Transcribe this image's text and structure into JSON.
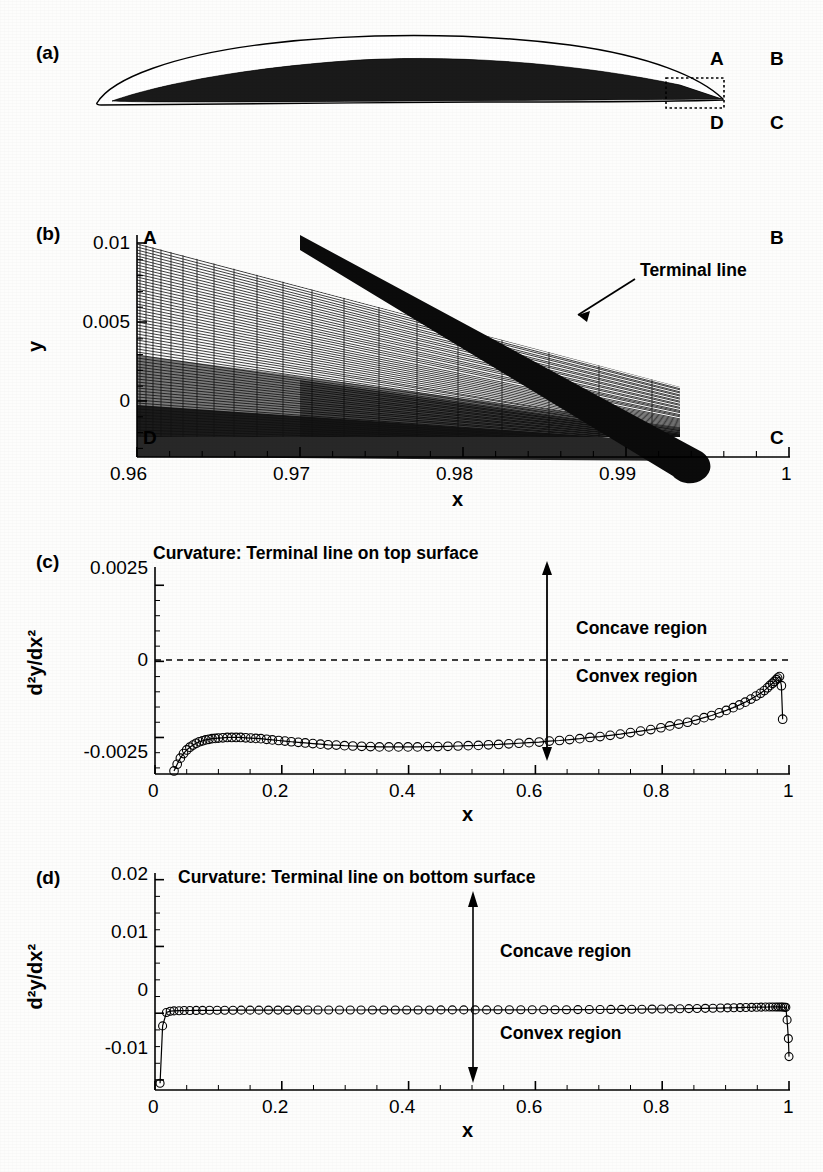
{
  "figure": {
    "panels": [
      "(a)",
      "(b)",
      "(c)",
      "(d)"
    ]
  },
  "panel_a": {
    "label": "(a)",
    "corner_labels": {
      "A": "A",
      "B": "B",
      "C": "C",
      "D": "D"
    },
    "description": "Airfoil with filled grid region and dotted zoom box at trailing edge"
  },
  "panel_b": {
    "label": "(b)",
    "corner_labels": {
      "A": "A",
      "B": "B",
      "C": "C",
      "D": "D"
    },
    "annotation": "Terminal line",
    "xlabel": "x",
    "ylabel": "y",
    "xticks": [
      "0.96",
      "0.97",
      "0.98",
      "0.99",
      "1"
    ],
    "yticks": [
      "0.01",
      "0.005",
      "0"
    ],
    "xlim": [
      0.96,
      1.0
    ],
    "ylim": [
      -0.0025,
      0.0115
    ]
  },
  "panel_c": {
    "label": "(c)",
    "title": "Curvature: Terminal line on top surface",
    "xlabel": "x",
    "ylabel": "d²y/dx²",
    "xticks": [
      "0",
      "0.2",
      "0.4",
      "0.6",
      "0.8",
      "1"
    ],
    "yticks": [
      "0.0025",
      "0",
      "-0.0025"
    ],
    "region_upper": "Concave region",
    "region_lower": "Convex region",
    "arrow_x": 0.63
  },
  "panel_d": {
    "label": "(d)",
    "title": "Curvature: Terminal line on bottom surface",
    "xlabel": "x",
    "ylabel": "d²y/dx²",
    "xticks": [
      "0",
      "0.2",
      "0.4",
      "0.6",
      "0.8",
      "1"
    ],
    "yticks": [
      "0.02",
      "0.01",
      "0",
      "-0.01"
    ],
    "region_upper": "Concave region",
    "region_lower": "Convex region",
    "arrow_x": 0.5
  },
  "chart_data": [
    {
      "id": "panel_c",
      "type": "line",
      "title": "Curvature: Terminal line on top surface",
      "xlabel": "x",
      "ylabel": "d2y/dx2",
      "xlim": [
        0,
        1
      ],
      "ylim": [
        -0.0037,
        0.0031
      ],
      "grid": false,
      "legend": null,
      "marker": "open-circle",
      "zero_line": true,
      "annotations": [
        "Concave region",
        "Convex region"
      ],
      "x": [
        0.03,
        0.035,
        0.04,
        0.045,
        0.05,
        0.055,
        0.06,
        0.065,
        0.07,
        0.075,
        0.08,
        0.085,
        0.09,
        0.095,
        0.1,
        0.107,
        0.114,
        0.121,
        0.128,
        0.135,
        0.143,
        0.151,
        0.159,
        0.167,
        0.176,
        0.185,
        0.195,
        0.205,
        0.215,
        0.226,
        0.237,
        0.249,
        0.261,
        0.273,
        0.286,
        0.299,
        0.312,
        0.326,
        0.34,
        0.354,
        0.369,
        0.384,
        0.399,
        0.414,
        0.43,
        0.446,
        0.462,
        0.478,
        0.494,
        0.51,
        0.526,
        0.542,
        0.558,
        0.574,
        0.59,
        0.606,
        0.622,
        0.638,
        0.654,
        0.67,
        0.686,
        0.702,
        0.718,
        0.734,
        0.75,
        0.766,
        0.782,
        0.798,
        0.812,
        0.826,
        0.84,
        0.853,
        0.866,
        0.878,
        0.89,
        0.901,
        0.912,
        0.922,
        0.931,
        0.94,
        0.948,
        0.955,
        0.961,
        0.966,
        0.97,
        0.974,
        0.977,
        0.98,
        0.982,
        0.985,
        0.988,
        0.99
      ],
      "y": [
        -0.0036,
        -0.00338,
        -0.00318,
        -0.00303,
        -0.00291,
        -0.00282,
        -0.00275,
        -0.00269,
        -0.00264,
        -0.00261,
        -0.00258,
        -0.00256,
        -0.00254,
        -0.00253,
        -0.00252,
        -0.00251,
        -0.0025,
        -0.0025,
        -0.0025,
        -0.0025,
        -0.00251,
        -0.00252,
        -0.00253,
        -0.00254,
        -0.00256,
        -0.00258,
        -0.0026,
        -0.00262,
        -0.00264,
        -0.00266,
        -0.00268,
        -0.0027,
        -0.00272,
        -0.00274,
        -0.00275,
        -0.00277,
        -0.00278,
        -0.00279,
        -0.0028,
        -0.00281,
        -0.00281,
        -0.00281,
        -0.00281,
        -0.00281,
        -0.0028,
        -0.0028,
        -0.00279,
        -0.00278,
        -0.00277,
        -0.00276,
        -0.00274,
        -0.00273,
        -0.00271,
        -0.00269,
        -0.00267,
        -0.00265,
        -0.00262,
        -0.0026,
        -0.00257,
        -0.00254,
        -0.0025,
        -0.00247,
        -0.00243,
        -0.00239,
        -0.00234,
        -0.00229,
        -0.00224,
        -0.00218,
        -0.00212,
        -0.00206,
        -0.002,
        -0.00193,
        -0.00185,
        -0.00178,
        -0.00169,
        -0.00161,
        -0.00152,
        -0.00143,
        -0.00134,
        -0.00124,
        -0.00114,
        -0.00105,
        -0.00096,
        -0.00087,
        -0.00079,
        -0.00072,
        -0.00066,
        -0.0006,
        -0.00055,
        -0.0005,
        -0.0008,
        -0.0019
      ]
    },
    {
      "id": "panel_d",
      "type": "line",
      "title": "Curvature: Terminal line on bottom surface",
      "xlabel": "x",
      "ylabel": "d2y/dx2",
      "xlim": [
        0,
        1
      ],
      "ylim": [
        -0.0115,
        0.021
      ],
      "grid": false,
      "legend": null,
      "marker": "open-circle",
      "zero_line": false,
      "annotations": [
        "Concave region",
        "Convex region"
      ],
      "x": [
        0.008,
        0.012,
        0.018,
        0.024,
        0.03,
        0.038,
        0.046,
        0.055,
        0.065,
        0.075,
        0.086,
        0.098,
        0.11,
        0.123,
        0.136,
        0.15,
        0.164,
        0.179,
        0.194,
        0.209,
        0.225,
        0.241,
        0.257,
        0.274,
        0.291,
        0.308,
        0.325,
        0.343,
        0.361,
        0.379,
        0.397,
        0.415,
        0.433,
        0.451,
        0.469,
        0.487,
        0.505,
        0.523,
        0.541,
        0.559,
        0.577,
        0.595,
        0.613,
        0.631,
        0.649,
        0.667,
        0.685,
        0.702,
        0.719,
        0.736,
        0.752,
        0.768,
        0.784,
        0.799,
        0.814,
        0.828,
        0.842,
        0.855,
        0.868,
        0.88,
        0.892,
        0.903,
        0.913,
        0.923,
        0.932,
        0.941,
        0.949,
        0.956,
        0.963,
        0.969,
        0.974,
        0.979,
        0.983,
        0.987,
        0.99,
        0.993,
        0.995,
        0.997,
        0.999,
        1.0
      ],
      "y": [
        -0.0105,
        -0.0019,
        0.0001,
        0.0003,
        0.00035,
        0.00038,
        0.0004,
        0.00041,
        0.00042,
        0.00043,
        0.00044,
        0.00044,
        0.00045,
        0.00045,
        0.00046,
        0.00046,
        0.00046,
        0.00047,
        0.00047,
        0.00047,
        0.00047,
        0.00048,
        0.00048,
        0.00048,
        0.00048,
        0.00048,
        0.00048,
        0.00049,
        0.00049,
        0.00049,
        0.00049,
        0.00049,
        0.00049,
        0.0005,
        0.0005,
        0.0005,
        0.0005,
        0.0005,
        0.00051,
        0.00051,
        0.00051,
        0.00052,
        0.00052,
        0.00053,
        0.00053,
        0.00054,
        0.00055,
        0.00056,
        0.00057,
        0.00058,
        0.00059,
        0.0006,
        0.00062,
        0.00063,
        0.00065,
        0.00067,
        0.00069,
        0.00071,
        0.00073,
        0.00075,
        0.00077,
        0.0008,
        0.00082,
        0.00084,
        0.00086,
        0.00088,
        0.0009,
        0.00091,
        0.00092,
        0.00093,
        0.00094,
        0.00094,
        0.00094,
        0.00093,
        0.00092,
        0.0009,
        0.00088,
        -0.001,
        -0.0038,
        -0.0065
      ]
    }
  ]
}
